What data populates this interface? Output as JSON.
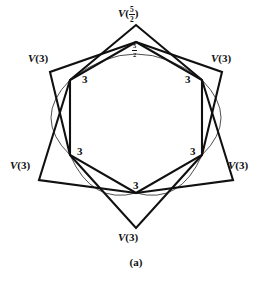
{
  "figure": {
    "caption": "(a)",
    "vertex_labels": [
      {
        "id": "top",
        "prefix": "V",
        "value": "5/2",
        "is_fraction": true,
        "numerator": "5",
        "denominator": "2",
        "x": 136,
        "y": 13
      },
      {
        "id": "upper-left",
        "prefix": "V",
        "value": "3",
        "is_fraction": false,
        "x": 46,
        "y": 59
      },
      {
        "id": "upper-right",
        "prefix": "V",
        "value": "3",
        "is_fraction": false,
        "x": 226,
        "y": 59
      },
      {
        "id": "lower-left",
        "prefix": "V",
        "value": "3",
        "is_fraction": false,
        "x": 28,
        "y": 166
      },
      {
        "id": "lower-right",
        "prefix": "V",
        "value": "3",
        "is_fraction": false,
        "x": 244,
        "y": 166
      },
      {
        "id": "bottom",
        "prefix": "V",
        "value": "3",
        "is_fraction": false,
        "x": 136,
        "y": 238
      }
    ],
    "edge_labels": [
      {
        "id": "edge-top",
        "value": "5/2",
        "is_fraction": true,
        "numerator": "5",
        "denominator": "2",
        "x": 136,
        "y": 48
      },
      {
        "id": "edge-upper-left",
        "value": "3",
        "is_fraction": false,
        "x": 85,
        "y": 80
      },
      {
        "id": "edge-upper-right",
        "value": "3",
        "is_fraction": false,
        "x": 188,
        "y": 80
      },
      {
        "id": "edge-lower-left",
        "value": "3",
        "is_fraction": false,
        "x": 80,
        "y": 152
      },
      {
        "id": "edge-lower-right",
        "value": "3",
        "is_fraction": false,
        "x": 193,
        "y": 152
      },
      {
        "id": "edge-bottom",
        "value": "3",
        "is_fraction": false,
        "x": 136,
        "y": 186
      }
    ],
    "colors": {
      "ink": "#101010",
      "background": "#ffffff",
      "thin_stroke": "#3a3a3a"
    },
    "geometry": {
      "inner_hexagon": [
        [
          136,
          42
        ],
        [
          202,
          80
        ],
        [
          202,
          155
        ],
        [
          136,
          193
        ],
        [
          70,
          155
        ],
        [
          70,
          80
        ]
      ],
      "outer_points": [
        [
          136,
          25
        ],
        [
          222,
          72
        ],
        [
          233,
          180
        ],
        [
          136,
          228
        ],
        [
          39,
          180
        ],
        [
          50,
          72
        ]
      ],
      "arc_sag": 8
    }
  }
}
